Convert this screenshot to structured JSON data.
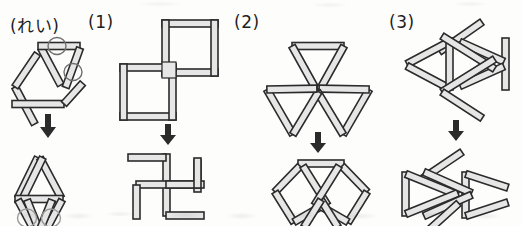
{
  "page": {
    "width": 522,
    "height": 226,
    "background_color": "#fdfdfc"
  },
  "style": {
    "stick_fill": "#e6e6e6",
    "stick_stroke": "#2b2b2b",
    "stick_stroke_width": 1.6,
    "stick_thickness": 7,
    "ring_stroke": "#6f6f6f",
    "arrow_color": "#2b2b2b",
    "label_color": "#1d1d1d"
  },
  "labels": {
    "example": "(れい)",
    "q1": "(1)",
    "q2": "(2)",
    "q3": "(3)"
  },
  "arrow": {
    "icon": "down-arrow-icon",
    "direction": "down",
    "count": 4
  },
  "panels": [
    {
      "id": "example",
      "label": "(れい)",
      "before": {
        "name": "two-triangles-with-marked-sticks",
        "shape": "Two triangles sharing a base line; two sticks are circled (marked) to show which ones move.",
        "stick_count": 7,
        "marked_sticks": 2,
        "marker_icon": "circle-marker-icon"
      },
      "after": {
        "name": "diamond-with-two-legs",
        "shape": "Upper triangle kept, horizontal base, and two marked sticks swung down into a lower V, with circles shown at their new positions.",
        "stick_count": 7,
        "marked_sticks": 2,
        "marker_icon": "circle-marker-icon"
      }
    },
    {
      "id": "q1",
      "label": "(1)",
      "before": {
        "name": "two-overlapping-squares",
        "shape": "Two squares of equal size touching corner-to-corner on a diagonal, upper-right and lower-left.",
        "stick_count": 8
      },
      "after": {
        "name": "pinwheel-of-sticks",
        "shape": "Pinwheel / manji arrangement: two long crossing sticks with four short sticks bent off their ends.",
        "stick_count": 8
      }
    },
    {
      "id": "q2",
      "label": "(2)",
      "before": {
        "name": "three-triangles-pinwheel",
        "shape": "Three identical triangles meeting at one central point, rotated 120 degrees apart.",
        "stick_count": 9
      },
      "after": {
        "name": "two-crossing-rhombi",
        "shape": "Two rhombi (diamonds) crossing near the top centre under a single horizontal stick.",
        "stick_count": 9
      }
    },
    {
      "id": "q3",
      "label": "(3)",
      "before": {
        "name": "bowtie-with-diagonals",
        "shape": "Two triangles facing each other like a bowtie, plus two long diagonal sticks crossing at the centre.",
        "stick_count": 10
      },
      "after": {
        "name": "fish-shape",
        "shape": "Fish-like figure: left triangle and right triangle joined by crossing sticks with two diagonal tail sticks.",
        "stick_count": 10
      }
    }
  ]
}
